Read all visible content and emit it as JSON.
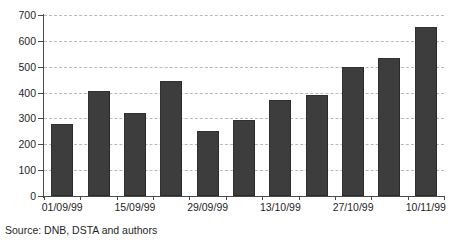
{
  "chart_data": {
    "type": "bar",
    "title": "",
    "subtitle": "",
    "xlabel": "",
    "ylabel": "",
    "ylim": [
      0,
      700
    ],
    "ytick_step": 100,
    "ytick_labels": [
      "700",
      "600",
      "500",
      "400",
      "300",
      "200",
      "100",
      "0"
    ],
    "ytick_values": [
      700,
      600,
      500,
      400,
      300,
      200,
      100,
      0
    ],
    "grid": "horizontal-dashed",
    "legend": "none",
    "bar_color": "#3d3d3d",
    "categories": [
      "01/09/99",
      "08/09/99",
      "15/09/99",
      "22/09/99",
      "29/09/99",
      "06/10/99",
      "13/10/99",
      "20/10/99",
      "27/10/99",
      "03/11/99",
      "10/11/99"
    ],
    "tick_labels_shown": [
      "01/09/99",
      "15/09/99",
      "29/09/99",
      "13/10/99",
      "27/10/99",
      "10/11/99"
    ],
    "values": [
      280,
      405,
      320,
      445,
      250,
      295,
      370,
      390,
      500,
      535,
      655
    ],
    "annotations": []
  },
  "source": {
    "note": "Source: DNB, DSTA and authors"
  }
}
